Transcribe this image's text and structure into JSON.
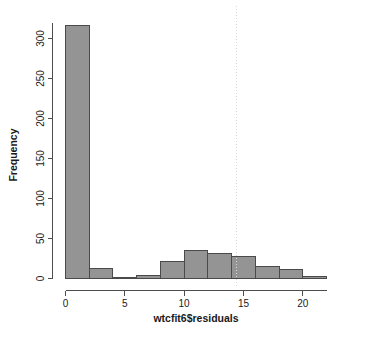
{
  "chart_data": {
    "type": "bar",
    "chart_kind": "histogram",
    "title": "",
    "xlabel": "wtcfit6$residuals",
    "ylabel": "Frequency",
    "xlim": [
      0,
      22
    ],
    "ylim": [
      0,
      320
    ],
    "xticks": [
      0,
      5,
      10,
      15,
      20
    ],
    "xtick_labels": [
      "0",
      "5",
      "10",
      "15",
      "20"
    ],
    "yticks": [
      0,
      50,
      100,
      150,
      200,
      250,
      300
    ],
    "ytick_labels": [
      "0",
      "50",
      "100",
      "150",
      "200",
      "250",
      "300"
    ],
    "grid": false,
    "legend": null,
    "bin_width": 2,
    "bin_edges": [
      0,
      2,
      4,
      6,
      8,
      10,
      12,
      14,
      16,
      18,
      20,
      22
    ],
    "categories": [
      "0-2",
      "2-4",
      "4-6",
      "6-8",
      "8-10",
      "10-12",
      "12-14",
      "14-16",
      "16-18",
      "18-20",
      "20-22"
    ],
    "values": [
      316,
      12,
      1,
      4,
      21,
      35,
      31,
      28,
      15,
      11,
      3
    ],
    "bar_fill_color": "#949494",
    "bar_border_color": "#4a4a4a",
    "annotations": [
      {
        "type": "vertical-line",
        "x": 14.4,
        "style": "dotted",
        "color": "#d8d8d8"
      }
    ]
  }
}
